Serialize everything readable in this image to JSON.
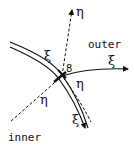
{
  "diagram": {
    "regions": {
      "outer": "outer",
      "inner": "inner"
    },
    "axes": {
      "outer_eta": "η",
      "outer_xi": "ξ",
      "inner_eta": "η",
      "boundary_eta": "η",
      "boundary_xi_upper": "ξ",
      "boundary_xi_lower": "ξ"
    },
    "point_label": "8",
    "colors": {
      "stroke": "#111111",
      "background": "#ffffff"
    }
  }
}
